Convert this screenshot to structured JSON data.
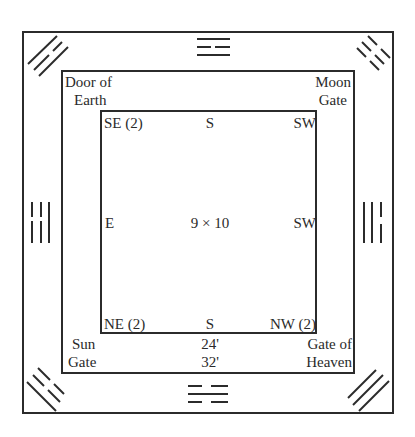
{
  "diagram": {
    "outer_frame": {
      "trigrams": {
        "top": "solid-broken-solid",
        "bottom": "broken-solid-broken",
        "left": "broken-broken-solid",
        "right": "solid-solid-broken",
        "top_left": "solid-broken-solid",
        "top_right": "broken-broken-broken",
        "bottom_left": "broken-broken-solid",
        "bottom_right": "solid-solid-solid"
      }
    },
    "gates": {
      "top_left": [
        "Door of",
        "Earth"
      ],
      "top_right": [
        "Moon",
        "Gate"
      ],
      "bottom_left": [
        "Sun",
        "Gate"
      ],
      "bottom_right": [
        "Gate of",
        "Heaven"
      ]
    },
    "inner": {
      "top_left": "SE (2)",
      "top_center": "S",
      "top_right": "SW",
      "middle_left": "E",
      "center": "9 × 10",
      "middle_right": "SW",
      "bottom_left": "NE (2)",
      "bottom_center": "S",
      "bottom_right": "NW (2)"
    },
    "dimensions": {
      "inner_width": "24'",
      "outer_width": "32'"
    }
  }
}
